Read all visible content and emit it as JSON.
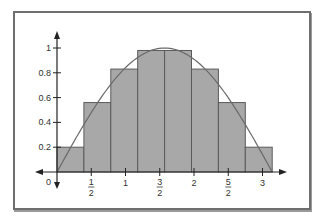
{
  "chart_data": {
    "type": "bar",
    "title": "",
    "xlabel": "",
    "ylabel": "",
    "bar_edges": [
      0,
      0.3927,
      0.7854,
      1.1781,
      1.5708,
      1.9635,
      2.3562,
      2.7489,
      3.1416
    ],
    "values": [
      0.2,
      0.56,
      0.83,
      0.98,
      0.98,
      0.83,
      0.56,
      0.2
    ],
    "curve": {
      "function": "sin(x)",
      "x_range": [
        0,
        3.1416
      ],
      "peak": 1
    },
    "x_ticks": [
      {
        "value": 0,
        "label": "0"
      },
      {
        "value": 0.5,
        "label": "1/2"
      },
      {
        "value": 1,
        "label": "1"
      },
      {
        "value": 1.5,
        "label": "3/2"
      },
      {
        "value": 2,
        "label": "2"
      },
      {
        "value": 2.5,
        "label": "5/2"
      },
      {
        "value": 3,
        "label": "3"
      }
    ],
    "y_ticks": [
      {
        "value": 0.2,
        "label": "0.2"
      },
      {
        "value": 0.4,
        "label": "0.4"
      },
      {
        "value": 0.6,
        "label": "0.6"
      },
      {
        "value": 0.8,
        "label": "0.8"
      },
      {
        "value": 1,
        "label": "1"
      }
    ],
    "xlim": [
      0,
      3.3
    ],
    "ylim": [
      0,
      1.1
    ],
    "grid": false,
    "colors": {
      "bar_fill": "#a8a8a8",
      "bar_stroke": "#5a5a5a",
      "curve": "#6a6a6a",
      "axis": "#222222"
    }
  }
}
